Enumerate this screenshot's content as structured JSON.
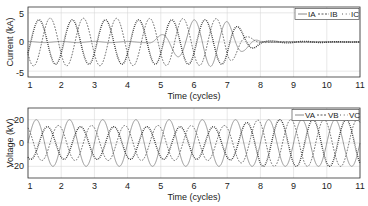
{
  "chart_data": [
    {
      "type": "line",
      "title": "",
      "xlabel": "Time (cycles)",
      "ylabel": "Current (kA)",
      "xlim": [
        1,
        11
      ],
      "ylim": [
        -6,
        6
      ],
      "xticks": [
        1,
        2,
        3,
        4,
        5,
        6,
        7,
        8,
        9,
        10,
        11
      ],
      "yticks": [
        -5,
        0,
        5
      ],
      "grid": true,
      "legend_position": "upper right",
      "series": [
        {
          "name": "IA",
          "style": "solid",
          "color": "#888888",
          "description": "Near 0 until ~4.7 cycles, then grows to ~4.2 kA amplitude by ~6.5 cycles, decays to 0 at ~8 cycles",
          "amplitude_profile": {
            "t": [
              1,
              4.6,
              5.0,
              6.0,
              6.5,
              7.0,
              7.5,
              8.0,
              11
            ],
            "amp": [
              0.1,
              0.1,
              1.2,
              3.8,
              4.2,
              3.5,
              1.5,
              0.1,
              0.0
            ]
          }
        },
        {
          "name": "IB",
          "style": "dashed",
          "color": "#555555",
          "description": "~4.1 kA amplitude until ~7 cycles, decays to 0 at ~8 cycles",
          "amplitude_profile": {
            "t": [
              1,
              7.0,
              7.5,
              8.0,
              11
            ],
            "amp": [
              4.1,
              4.0,
              1.2,
              0.1,
              0.0
            ]
          }
        },
        {
          "name": "IC",
          "style": "dash-dot",
          "color": "#333333",
          "description": "~3.8 kA amplitude until ~7 cycles, decays to 0 at ~8 cycles",
          "amplitude_profile": {
            "t": [
              1,
              7.0,
              7.6,
              8.1,
              11
            ],
            "amp": [
              3.8,
              3.8,
              1.6,
              0.2,
              0.0
            ]
          }
        }
      ]
    },
    {
      "type": "line",
      "title": "",
      "xlabel": "Time (cycles)",
      "ylabel": "Voltage (kV)",
      "xlim": [
        1,
        11
      ],
      "ylim": [
        -30,
        30
      ],
      "xticks": [
        1,
        2,
        3,
        4,
        5,
        6,
        7,
        8,
        9,
        10,
        11
      ],
      "yticks": [
        -20,
        0,
        20
      ],
      "grid": true,
      "legend_position": "upper right",
      "series": [
        {
          "name": "VA",
          "style": "solid",
          "color": "#888888",
          "description": "~20 kV amplitude sinusoid throughout",
          "amplitude_profile": {
            "t": [
              1,
              11
            ],
            "amp": [
              20,
              20
            ]
          }
        },
        {
          "name": "VB",
          "style": "dashed",
          "color": "#555555",
          "description": "~15 kV amplitude before ~7 cycles, rises to ~20 kV after ~8 cycles",
          "amplitude_profile": {
            "t": [
              1,
              7.0,
              8.0,
              11
            ],
            "amp": [
              15,
              15,
              20,
              20
            ]
          }
        },
        {
          "name": "VC",
          "style": "dash-dot",
          "color": "#333333",
          "description": "~14 kV amplitude before ~7 cycles, rises to ~20 kV after ~8 cycles",
          "amplitude_profile": {
            "t": [
              1,
              7.0,
              8.0,
              11
            ],
            "amp": [
              14,
              14,
              20,
              20
            ]
          }
        }
      ]
    }
  ],
  "top": {
    "ylabel": "Current (kA)",
    "xlabel": "Time (cycles)",
    "yticks": [
      "5",
      "0",
      "-5"
    ],
    "xticks": [
      "1",
      "2",
      "3",
      "4",
      "5",
      "6",
      "7",
      "8",
      "9",
      "10",
      "11"
    ],
    "legend": [
      "IA",
      "IB",
      "IC"
    ]
  },
  "bottom": {
    "ylabel": "Voltage (kV)",
    "xlabel": "Time (cycles)",
    "yticks": [
      "20",
      "0",
      "-20"
    ],
    "xticks": [
      "1",
      "2",
      "3",
      "4",
      "5",
      "6",
      "7",
      "8",
      "9",
      "10",
      "11"
    ],
    "legend": [
      "VA",
      "VB",
      "VC"
    ]
  }
}
